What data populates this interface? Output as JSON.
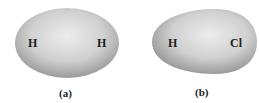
{
  "diagram": {
    "panels": [
      {
        "id": "a",
        "caption": "(a)",
        "shape": "symmetric-ellipse",
        "atoms": [
          "H",
          "H"
        ]
      },
      {
        "id": "b",
        "caption": "(b)",
        "shape": "asymmetric-egg",
        "atoms": [
          "H",
          "Cl"
        ]
      }
    ],
    "colors": {
      "cloud_center": "#e6e6e6",
      "cloud_edge": "#9a9a9a",
      "text": "#222222"
    }
  }
}
